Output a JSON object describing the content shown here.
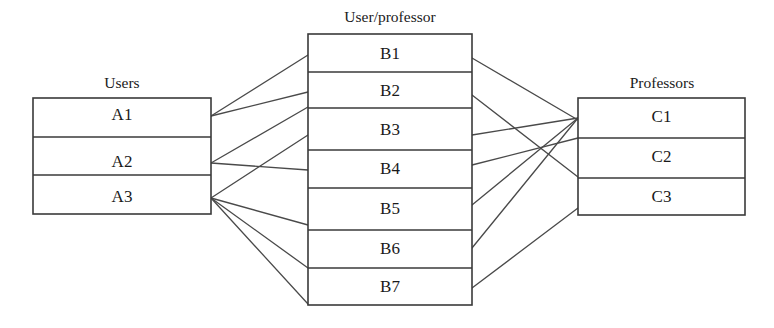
{
  "diagram": {
    "type": "bipartite-relationship-diagram",
    "background_color": "#ffffff",
    "line_color": "#4a4a4a",
    "border_color": "#3a3a3a",
    "text_color": "#1a1a1a",
    "tables": [
      {
        "id": "users",
        "title": "Users",
        "title_x": 122,
        "title_y": 84,
        "x": 33,
        "y": 98,
        "width": 178,
        "height": 116,
        "rows": [
          {
            "label": "A1",
            "anchor_y": 116
          },
          {
            "label": "A2",
            "anchor_y": 163
          },
          {
            "label": "A3",
            "anchor_y": 198
          }
        ],
        "dividers": [
          137,
          175
        ]
      },
      {
        "id": "user_professor",
        "title": "User/professor",
        "title_x": 390,
        "title_y": 18,
        "x": 308,
        "y": 34,
        "width": 164,
        "height": 271,
        "rows": [
          {
            "label": "B1",
            "anchor_y": 55
          },
          {
            "label": "B2",
            "anchor_y": 92
          },
          {
            "label": "B3",
            "anchor_y": 131
          },
          {
            "label": "B4",
            "anchor_y": 170
          },
          {
            "label": "B5",
            "anchor_y": 210
          },
          {
            "label": "B6",
            "anchor_y": 250
          },
          {
            "label": "B7",
            "anchor_y": 288
          }
        ],
        "dividers": [
          72,
          108,
          150,
          188,
          230,
          268
        ]
      },
      {
        "id": "professors",
        "title": "Professors",
        "title_x": 662,
        "title_y": 84,
        "x": 578,
        "y": 98,
        "width": 167,
        "height": 117,
        "rows": [
          {
            "label": "C1",
            "anchor_y": 118
          },
          {
            "label": "C2",
            "anchor_y": 158
          },
          {
            "label": "C3",
            "anchor_y": 198
          }
        ],
        "dividers": [
          138,
          178
        ]
      }
    ],
    "links_left": [
      {
        "from": "A1",
        "to": "B1",
        "x1": 211,
        "y1": 116,
        "x2": 308,
        "y2": 55
      },
      {
        "from": "A1",
        "to": "B2",
        "x1": 211,
        "y1": 116,
        "x2": 308,
        "y2": 92
      },
      {
        "from": "A2",
        "to": "B3",
        "x1": 211,
        "y1": 163,
        "x2": 308,
        "y2": 107
      },
      {
        "from": "A2",
        "to": "B4",
        "x1": 211,
        "y1": 163,
        "x2": 308,
        "y2": 170
      },
      {
        "from": "A3",
        "to": "B3",
        "x1": 211,
        "y1": 198,
        "x2": 308,
        "y2": 135
      },
      {
        "from": "A3",
        "to": "B5",
        "x1": 211,
        "y1": 198,
        "x2": 308,
        "y2": 225
      },
      {
        "from": "A3",
        "to": "B6",
        "x1": 211,
        "y1": 198,
        "x2": 308,
        "y2": 268
      },
      {
        "from": "A3",
        "to": "B7",
        "x1": 211,
        "y1": 198,
        "x2": 308,
        "y2": 304
      }
    ],
    "links_right": [
      {
        "from": "B1",
        "to": "C1",
        "x1": 472,
        "y1": 58,
        "x2": 578,
        "y2": 120
      },
      {
        "from": "B2",
        "to": "C2",
        "x1": 472,
        "y1": 95,
        "x2": 578,
        "y2": 177
      },
      {
        "from": "B3",
        "to": "C1",
        "x1": 472,
        "y1": 135,
        "x2": 578,
        "y2": 118
      },
      {
        "from": "B4",
        "to": "C2",
        "x1": 472,
        "y1": 165,
        "x2": 578,
        "y2": 138
      },
      {
        "from": "B5",
        "to": "C1",
        "x1": 472,
        "y1": 205,
        "x2": 578,
        "y2": 118
      },
      {
        "from": "B6",
        "to": "C3",
        "x1": 472,
        "y1": 248,
        "x2": 578,
        "y2": 118
      },
      {
        "from": "B7",
        "to": "C3",
        "x1": 472,
        "y1": 288,
        "x2": 578,
        "y2": 208
      }
    ]
  }
}
